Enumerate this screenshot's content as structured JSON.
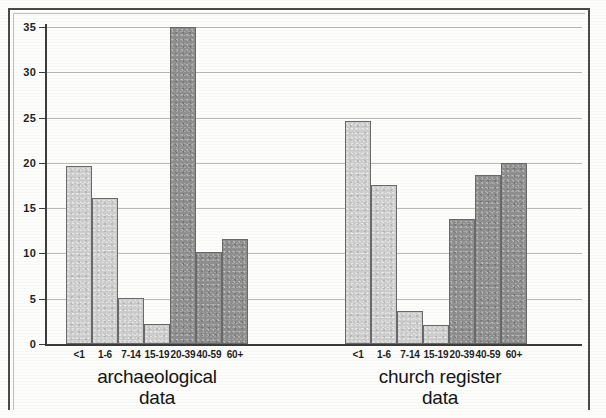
{
  "chart_data": {
    "type": "bar",
    "title": "",
    "subtitle": "",
    "xlabel": "",
    "ylabel": "",
    "ylim": [
      0,
      35
    ],
    "ytick_labels": [
      "0",
      "5",
      "10",
      "15",
      "20",
      "25",
      "30",
      "35"
    ],
    "ytick_values": [
      0,
      5,
      10,
      15,
      20,
      25,
      30,
      35
    ],
    "grid": true,
    "legend": "none",
    "categories": [
      "<1",
      "1-6",
      "7-14",
      "15-19",
      "20-39",
      "40-59",
      "60+"
    ],
    "groups": [
      {
        "name": "archaeological data",
        "label_line1": "archaeological",
        "label_line2": "data",
        "values": [
          19.7,
          16.1,
          5.1,
          2.2,
          35.0,
          10.2,
          11.6
        ],
        "bar_shades": [
          "light",
          "light",
          "light",
          "light",
          "dark",
          "dark",
          "dark"
        ]
      },
      {
        "name": "church register data",
        "label_line1": "church register",
        "label_line2": "data",
        "values": [
          24.6,
          17.6,
          3.7,
          2.1,
          13.8,
          18.7,
          20.0
        ],
        "bar_shades": [
          "light",
          "light",
          "light",
          "light",
          "dark",
          "dark",
          "dark"
        ]
      }
    ],
    "colors": {
      "bar_light": "#cdcdcd",
      "bar_dark": "#8f8f8f",
      "bar_border": "#6a6a6a",
      "axis": "#3c3c3c",
      "gridline": "#b9b9b9",
      "frame": "#4a4a4a",
      "background": "#fdfdfc",
      "text": "#1b1b1b"
    }
  }
}
